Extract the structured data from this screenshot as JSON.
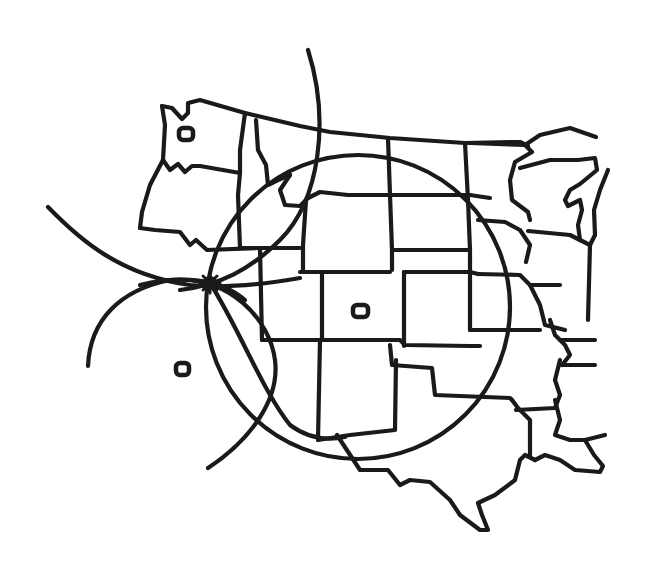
{
  "map": {
    "title": "",
    "colors": {
      "line": "#1a1a1a",
      "background": "#ffffff"
    },
    "markers": [
      {
        "id": "station-northwest",
        "x": 186,
        "y": 134,
        "icon": "rounded-square-marker"
      },
      {
        "id": "station-center",
        "x": 360,
        "y": 311,
        "icon": "rounded-square-marker"
      },
      {
        "id": "station-southwest",
        "x": 182,
        "y": 369,
        "icon": "rounded-square-marker"
      }
    ],
    "range_circles": [
      {
        "id": "range-circle-large",
        "cx": 358,
        "cy": 307,
        "r": 152
      },
      {
        "id": "range-circle-northwest-arc",
        "description": "arc centered on northwest station"
      },
      {
        "id": "range-circle-southwest-arc",
        "description": "arc centered on southwest station"
      }
    ],
    "intersection_point": {
      "x": 210,
      "y": 283,
      "icon": "starburst-intersection"
    }
  }
}
